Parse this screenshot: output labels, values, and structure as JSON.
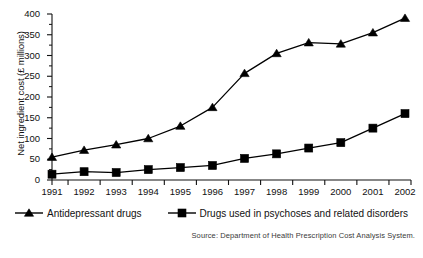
{
  "chart_data": {
    "type": "line",
    "title": "",
    "xlabel": "",
    "ylabel": "Net ingredient cost (£ millions)",
    "categories": [
      "1991",
      "1992",
      "1993",
      "1994",
      "1995",
      "1996",
      "1997",
      "1998",
      "1999",
      "2000",
      "2001",
      "2002"
    ],
    "x": [
      1991,
      1992,
      1993,
      1994,
      1995,
      1996,
      1997,
      1998,
      1999,
      2000,
      2001,
      2002
    ],
    "ylim": [
      0,
      400
    ],
    "yticks": [
      0,
      50,
      100,
      150,
      200,
      250,
      300,
      350,
      400
    ],
    "ytick_labels": [
      "0",
      "50",
      "100",
      "150",
      "200",
      "250",
      "300",
      "350",
      "400"
    ],
    "grid": false,
    "legend_position": "bottom",
    "series": [
      {
        "name": "Antidepressant drugs",
        "marker": "triangle",
        "color": "#000000",
        "values": [
          55,
          72,
          85,
          100,
          130,
          175,
          257,
          305,
          331,
          328,
          355,
          390
        ]
      },
      {
        "name": "Drugs used in psychoses and related disorders",
        "marker": "square",
        "color": "#000000",
        "values": [
          14,
          20,
          18,
          25,
          30,
          35,
          52,
          63,
          77,
          90,
          125,
          160
        ]
      }
    ],
    "annotations": {
      "source": "Source: Department of Health Prescription Cost Analysis System."
    }
  },
  "legend": {
    "items": [
      {
        "label": "Antidepressant drugs",
        "marker": "triangle-marker-icon"
      },
      {
        "label": "Drugs used in psychoses and related disorders",
        "marker": "square-marker-icon"
      }
    ]
  },
  "source": {
    "text": "Source: Department of Health Prescription Cost Analysis System."
  }
}
